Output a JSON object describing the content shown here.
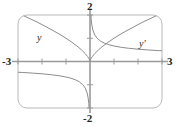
{
  "figure": {
    "name": "graph-of-y-and-y-prime",
    "frame": {
      "x_min": -3,
      "x_max": 3,
      "y_min": -2,
      "y_max": 2
    },
    "axis_labels": {
      "left": "-3",
      "right": "3",
      "top": "2",
      "bottom": "-2"
    },
    "curve_labels": {
      "y": "y",
      "y_prime": "y′"
    },
    "colors": {
      "curve": "#8c8c8c",
      "axis": "#9a9a9a",
      "frame": "#b9b9b9",
      "text": "#231f20",
      "background": "#ffffff"
    }
  },
  "chart_data": {
    "type": "line",
    "title": "",
    "xlabel": "",
    "ylabel": "",
    "xlim": [
      -3,
      3
    ],
    "ylim": [
      -2,
      2
    ],
    "grid": false,
    "legend": "inline-curve-labels",
    "xticks": [
      -3,
      -2,
      -1,
      0,
      1,
      2,
      3
    ],
    "yticks": [
      -2,
      -1,
      0,
      1,
      2
    ],
    "xtick_labels": [
      "-3",
      "",
      "",
      "",
      "",
      "",
      "3"
    ],
    "ytick_labels": [
      "-2",
      "",
      "",
      "",
      "2"
    ],
    "annotations": [
      {
        "text": "y",
        "x": -2.15,
        "y": 1.33
      },
      {
        "text": "y′",
        "x": 2.05,
        "y": 0.92
      }
    ],
    "series": [
      {
        "name": "y",
        "label": "y",
        "formula": "y = x^(2/3)",
        "style": "solid",
        "color": "#8c8c8c",
        "x": [
          -3.0,
          -2.75,
          -2.5,
          -2.25,
          -2.0,
          -1.75,
          -1.5,
          -1.25,
          -1.0,
          -0.75,
          -0.5,
          -0.35,
          -0.2,
          -0.1,
          -0.04,
          -0.01,
          0.0,
          0.01,
          0.04,
          0.1,
          0.2,
          0.35,
          0.5,
          0.75,
          1.0,
          1.25,
          1.5,
          1.75,
          2.0,
          2.25,
          2.5,
          2.75,
          3.0
        ],
        "y": [
          2.08,
          1.96,
          1.84,
          1.72,
          1.587,
          1.447,
          1.31,
          1.16,
          1.0,
          0.825,
          0.63,
          0.494,
          0.342,
          0.215,
          0.117,
          0.046,
          0.0,
          0.046,
          0.117,
          0.215,
          0.342,
          0.494,
          0.63,
          0.825,
          1.0,
          1.16,
          1.31,
          1.447,
          1.587,
          1.72,
          1.84,
          1.96,
          2.08
        ]
      },
      {
        "name": "y_prime_positive_branch",
        "label": "y′",
        "formula": "y′ = (2/3)x^(-1/3)",
        "style": "solid",
        "color": "#8c8c8c",
        "x": [
          0.035,
          0.05,
          0.08,
          0.12,
          0.2,
          0.3,
          0.45,
          0.6,
          0.8,
          1.0,
          1.3,
          1.6,
          2.0,
          2.4,
          2.8,
          3.0
        ],
        "y": [
          2.03,
          1.81,
          1.55,
          1.35,
          1.14,
          0.996,
          0.869,
          0.79,
          0.718,
          0.667,
          0.61,
          0.571,
          0.529,
          0.498,
          0.472,
          0.462
        ]
      },
      {
        "name": "y_prime_negative_branch",
        "label": "y′",
        "formula": "y′ = (2/3)x^(-1/3)",
        "style": "solid",
        "color": "#8c8c8c",
        "x": [
          -3.0,
          -2.8,
          -2.4,
          -2.0,
          -1.6,
          -1.3,
          -1.0,
          -0.8,
          -0.6,
          -0.45,
          -0.3,
          -0.2,
          -0.12,
          -0.08,
          -0.05,
          -0.035
        ],
        "y": [
          -0.462,
          -0.472,
          -0.498,
          -0.529,
          -0.571,
          -0.61,
          -0.667,
          -0.718,
          -0.79,
          -0.869,
          -0.996,
          -1.14,
          -1.35,
          -1.55,
          -1.81,
          -2.03
        ]
      }
    ]
  }
}
